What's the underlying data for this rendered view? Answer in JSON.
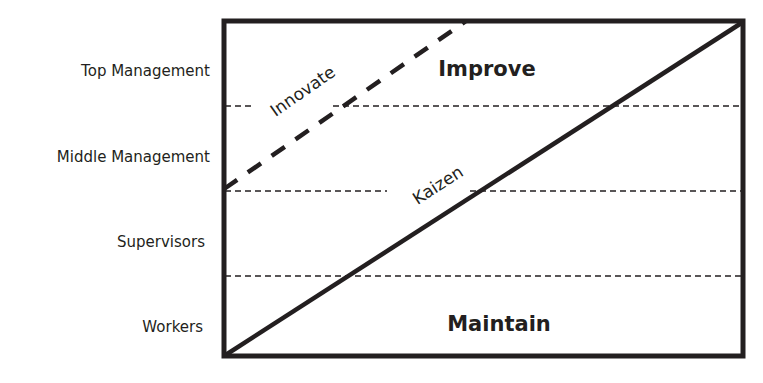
{
  "diagram": {
    "type": "kaizen-innovation-maintenance-chart",
    "levels": [
      {
        "label": "Top Management"
      },
      {
        "label": "Middle Management"
      },
      {
        "label": "Supervisors"
      },
      {
        "label": "Workers"
      }
    ],
    "regions": {
      "upper": "Improve",
      "lower": "Maintain"
    },
    "lines": {
      "innovate": {
        "label": "Innovate",
        "style": "dashed"
      },
      "kaizen": {
        "label": "Kaizen",
        "style": "solid"
      }
    },
    "colors": {
      "ink": "#231f20",
      "background": "#ffffff"
    }
  }
}
